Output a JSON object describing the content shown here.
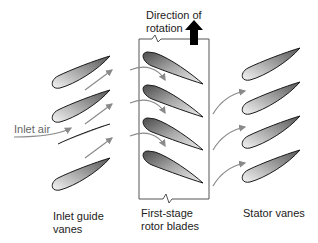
{
  "labels": {
    "direction_of_rotation_line1": "Direction of",
    "direction_of_rotation_line2": "rotation",
    "inlet_air": "Inlet air",
    "inlet_guide_vanes_line1": "Inlet guide",
    "inlet_guide_vanes_line2": "vanes",
    "rotor_blades_line1": "First-stage",
    "rotor_blades_line2": "rotor blades",
    "stator_vanes": "Stator vanes"
  },
  "colors": {
    "blade_dark": "#5a5a5a",
    "blade_light": "#f2f2f2",
    "outline": "#1a1a1a",
    "flow_arrow": "#8a8a8a",
    "rotation_arrow": "#000000",
    "box_line": "#555555"
  },
  "groups": {
    "inlet_guide_vanes_count": 4,
    "rotor_blades_count": 4,
    "stator_vanes_count": 4
  }
}
